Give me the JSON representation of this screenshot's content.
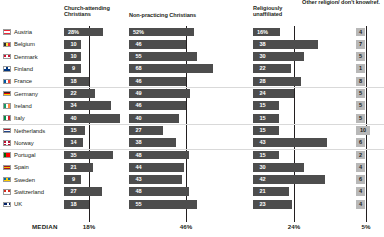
{
  "headers": {
    "col1": "Church-attending Christians",
    "col2": "Non-practicing Christians",
    "col3": "Religiously unaffiliated",
    "col4": "Other religion/ don't know/ref."
  },
  "median": {
    "label": "MEDIAN",
    "col1": "18%",
    "col2": "46%",
    "col3": "24%",
    "col4": "5%"
  },
  "colors": {
    "bar": "#4d4d4d",
    "cell4": "#b8b8b8",
    "gridline": "#231f20",
    "text": "#231f20",
    "bar_text": "#ffffff",
    "background": "#ffffff"
  },
  "chart_data": {
    "type": "bar",
    "title": "",
    "xlabel": "",
    "ylabel": "",
    "grid": true,
    "legend": "none",
    "categories": [
      "Austria",
      "Belgium",
      "Denmark",
      "Finland",
      "France",
      "Germany",
      "Ireland",
      "Italy",
      "Netherlands",
      "Norway",
      "Portugal",
      "Spain",
      "Sweden",
      "Switzerland",
      "UK"
    ],
    "series": [
      {
        "name": "Church-attending Christians",
        "median": 18,
        "values": [
          28,
          10,
          10,
          9,
          18,
          22,
          34,
          40,
          15,
          14,
          35,
          21,
          9,
          27,
          18
        ],
        "labels": [
          "28%",
          "10",
          "10",
          "9",
          "18",
          "22",
          "34",
          "40",
          "15",
          "14",
          "35",
          "21",
          "9",
          "27",
          "18"
        ]
      },
      {
        "name": "Non-practicing Christians",
        "median": 46,
        "values": [
          52,
          46,
          55,
          68,
          46,
          49,
          46,
          40,
          27,
          38,
          48,
          44,
          43,
          48,
          55
        ],
        "labels": [
          "52%",
          "46",
          "55",
          "68",
          "46",
          "49",
          "46",
          "40",
          "27",
          "38",
          "48",
          "44",
          "43",
          "48",
          "55"
        ]
      },
      {
        "name": "Religiously unaffiliated",
        "median": 24,
        "values": [
          16,
          38,
          30,
          22,
          28,
          24,
          15,
          15,
          15,
          43,
          15,
          30,
          42,
          21,
          23
        ],
        "labels": [
          "16%",
          "38",
          "30",
          "22",
          "28",
          "24",
          "15",
          "15",
          "15",
          "43",
          "15",
          "30",
          "42",
          "21",
          "23"
        ]
      },
      {
        "name": "Other religion/don't know/ref.",
        "median": 5,
        "values": [
          4,
          7,
          5,
          1,
          8,
          5,
          5,
          5,
          10,
          6,
          2,
          4,
          6,
          4,
          4
        ],
        "labels": [
          "4",
          "7",
          "5",
          "1",
          "8",
          "5",
          "5",
          "5",
          "10",
          "6",
          "2",
          "4",
          "6",
          "4",
          "4"
        ]
      }
    ]
  }
}
